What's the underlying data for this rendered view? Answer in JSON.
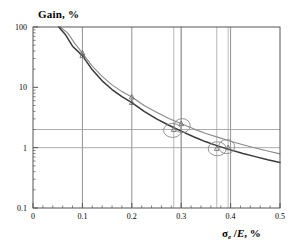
{
  "chart_data": {
    "type": "line",
    "title": "Gain, %",
    "xlabel": "σe /E, %",
    "ylabel": "Gain, %",
    "yscale": "log",
    "xscale": "linear",
    "xlim": [
      0,
      0.5
    ],
    "ylim": [
      0.1,
      100
    ],
    "grid": true,
    "legend": "none",
    "xticks": [
      "0",
      "0.1",
      "0.2",
      "0.3",
      "0.4",
      "0.5"
    ],
    "xtick_values": [
      0,
      0.1,
      0.2,
      0.3,
      0.4,
      0.5
    ],
    "yticks": [
      "100",
      "10",
      "1",
      "0.1"
    ],
    "ytick_values": [
      100,
      10,
      1,
      0.1
    ],
    "series": [
      {
        "name": "upper-curve",
        "color": "#8a8a8a",
        "x": [
          0.055,
          0.07,
          0.085,
          0.1,
          0.12,
          0.14,
          0.16,
          0.18,
          0.2,
          0.225,
          0.25,
          0.275,
          0.3,
          0.325,
          0.35,
          0.375,
          0.4,
          0.425,
          0.45,
          0.475,
          0.5
        ],
        "y": [
          100,
          80,
          53,
          37,
          22.5,
          15.2,
          11.0,
          8.5,
          6.9,
          5.0,
          3.85,
          3.05,
          2.5,
          2.05,
          1.72,
          1.48,
          1.28,
          1.12,
          0.99,
          0.88,
          0.79
        ]
      },
      {
        "name": "lower-curve",
        "color": "#3a3a3a",
        "x": [
          0.052,
          0.065,
          0.08,
          0.1,
          0.12,
          0.14,
          0.16,
          0.18,
          0.2,
          0.225,
          0.25,
          0.275,
          0.3,
          0.325,
          0.35,
          0.375,
          0.4,
          0.425,
          0.45,
          0.475,
          0.5
        ],
        "y": [
          100,
          76,
          48,
          33.5,
          19.5,
          12.8,
          9.2,
          7.0,
          5.6,
          4.0,
          3.0,
          2.35,
          1.88,
          1.52,
          1.25,
          1.06,
          0.92,
          0.8,
          0.71,
          0.63,
          0.57
        ]
      }
    ],
    "markers": [
      {
        "name": "marker-upper-01",
        "x": 0.1,
        "y": 37,
        "shape": "triangle",
        "series": "upper-curve"
      },
      {
        "name": "marker-lower-01",
        "x": 0.1,
        "y": 33.5,
        "shape": "triangle",
        "series": "lower-curve"
      },
      {
        "name": "marker-upper-02",
        "x": 0.2,
        "y": 6.9,
        "shape": "triangle",
        "series": "upper-curve"
      },
      {
        "name": "marker-lower-02",
        "x": 0.2,
        "y": 5.6,
        "shape": "triangle",
        "series": "lower-curve"
      },
      {
        "name": "marker-upper-03",
        "x": 0.3,
        "y": 2.5,
        "shape": "triangle",
        "series": "upper-curve"
      },
      {
        "name": "marker-lower-03",
        "x": 0.285,
        "y": 2.0,
        "shape": "triangle",
        "series": "lower-curve"
      },
      {
        "name": "marker-upper-04",
        "x": 0.395,
        "y": 1.0,
        "shape": "triangle",
        "series": "upper-curve"
      },
      {
        "name": "marker-lower-04",
        "x": 0.372,
        "y": 0.97,
        "shape": "triangle",
        "series": "lower-curve"
      }
    ],
    "highlight_circles": [
      {
        "name": "highlight-circle-left-a",
        "x": 0.2825,
        "y": 1.93,
        "rx_px": 9,
        "ry_px": 7
      },
      {
        "name": "highlight-circle-left-b",
        "x": 0.302,
        "y": 2.32,
        "rx_px": 8,
        "ry_px": 7
      },
      {
        "name": "highlight-circle-right-a",
        "x": 0.373,
        "y": 0.96,
        "rx_px": 9,
        "ry_px": 7
      },
      {
        "name": "highlight-circle-right-b",
        "x": 0.392,
        "y": 1.04,
        "rx_px": 8,
        "ry_px": 7
      }
    ],
    "reference_lines": [
      {
        "name": "hline-gain-2",
        "orientation": "horizontal",
        "value": 2
      },
      {
        "name": "hline-gain-1",
        "orientation": "horizontal",
        "value": 1
      },
      {
        "name": "vline-0285",
        "orientation": "vertical",
        "value": 0.285
      },
      {
        "name": "vline-0300",
        "orientation": "vertical",
        "value": 0.3
      },
      {
        "name": "vline-0372",
        "orientation": "vertical",
        "value": 0.372
      },
      {
        "name": "vline-0395",
        "orientation": "vertical",
        "value": 0.395
      }
    ],
    "gridlines_x": [
      0.1,
      0.2,
      0.3,
      0.4
    ],
    "annotations": []
  },
  "colors": {
    "frame": "#555555",
    "grid": "#777777",
    "reference": "#999999",
    "upper_curve": "#8a8a8a",
    "lower_curve": "#3a3a3a",
    "marker": "#666666",
    "circle": "#888888",
    "text": "#000000",
    "background": "#ffffff"
  }
}
